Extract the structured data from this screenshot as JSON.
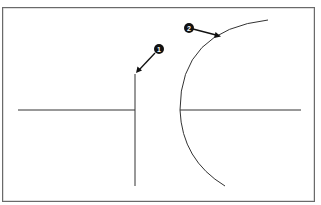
{
  "diagram": {
    "callouts": [
      {
        "number": "1",
        "target": "vertical-line-top"
      },
      {
        "number": "2",
        "target": "arc"
      }
    ],
    "colors": {
      "line": "#333333",
      "frame": "#6a6a6a",
      "badge": "#111111",
      "background": "#ffffff"
    }
  }
}
